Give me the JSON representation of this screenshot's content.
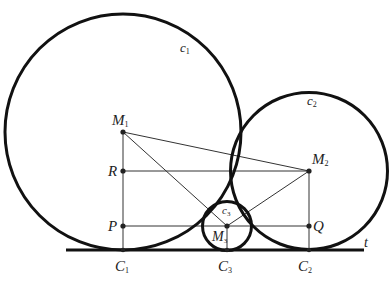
{
  "diagram": {
    "circles": [
      {
        "name": "c1",
        "cx": 123,
        "cy": 132,
        "r": 118
      },
      {
        "name": "c2",
        "cx": 309,
        "cy": 171,
        "r": 78.5
      },
      {
        "name": "c3",
        "cx": 227,
        "cy": 226,
        "r": 24.5
      }
    ],
    "tangent_line": {
      "label": "t",
      "x1": 66,
      "y1": 250,
      "x2": 364,
      "y2": 250
    },
    "points": {
      "M1": {
        "x": 123,
        "y": 132
      },
      "M2": {
        "x": 309,
        "y": 171
      },
      "M3": {
        "x": 227,
        "y": 226
      },
      "R": {
        "x": 123,
        "y": 171
      },
      "P": {
        "x": 123,
        "y": 226
      },
      "Q": {
        "x": 309,
        "y": 226
      },
      "C1": {
        "x": 123,
        "y": 250
      },
      "C2": {
        "x": 309,
        "y": 250
      },
      "C3": {
        "x": 227,
        "y": 250
      }
    },
    "labels": {
      "c1": {
        "base": "c",
        "sub": "1"
      },
      "c2": {
        "base": "c",
        "sub": "2"
      },
      "c3": {
        "base": "c",
        "sub": "3"
      },
      "M1": {
        "base": "M",
        "sub": "1"
      },
      "M2": {
        "base": "M",
        "sub": "2"
      },
      "M3": {
        "base": "M",
        "sub": "3"
      },
      "R": {
        "base": "R"
      },
      "P": {
        "base": "P"
      },
      "Q": {
        "base": "Q"
      },
      "C1": {
        "base": "C",
        "sub": "1"
      },
      "C2": {
        "base": "C",
        "sub": "2"
      },
      "C3": {
        "base": "C",
        "sub": "3"
      },
      "t": {
        "base": "t"
      }
    },
    "colors": {
      "stroke": "#111111",
      "thin": "#333333"
    }
  }
}
